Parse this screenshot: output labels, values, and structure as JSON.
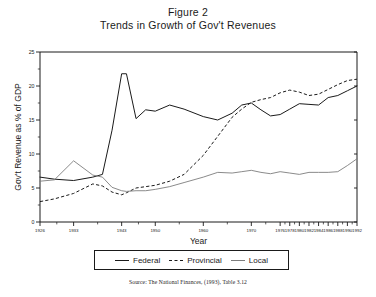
{
  "title": {
    "line1": "Figure 2",
    "line2": "Trends in Growth of Gov't Revenues"
  },
  "source": {
    "text": "Source:  The National Finances, (1993), Table 3.12"
  },
  "legend": {
    "federal": "Federal",
    "provincial": "Provincial",
    "local": "Local"
  },
  "chart_data": {
    "type": "line",
    "title": "Trends in Growth of Gov't Revenues",
    "subtitle": "Figure 2",
    "xlabel": "Year",
    "ylabel": "Gov't Revenue as % of GDP",
    "xlim": [
      1926,
      1992
    ],
    "ylim": [
      0,
      25
    ],
    "yticks": [
      0,
      5,
      10,
      15,
      20,
      25
    ],
    "ytick_labels": [
      "0",
      "5",
      "10",
      "15",
      "20",
      "25"
    ],
    "xtick_labels": [
      "1926",
      "1933",
      "1943",
      "1950",
      "1960",
      "1970",
      "1976",
      "1978",
      "1980",
      "1982",
      "1984",
      "1986",
      "1988",
      "1990",
      "1992"
    ],
    "xticks": [
      1926,
      1933,
      1943,
      1950,
      1960,
      1970,
      1976,
      1978,
      1980,
      1982,
      1984,
      1986,
      1988,
      1990,
      1992
    ],
    "grid": false,
    "legend_position": "bottom",
    "x": [
      1926,
      1929,
      1933,
      1937,
      1939,
      1941,
      1943,
      1944,
      1946,
      1948,
      1950,
      1953,
      1956,
      1960,
      1963,
      1966,
      1968,
      1970,
      1972,
      1974,
      1976,
      1978,
      1980,
      1982,
      1984,
      1986,
      1988,
      1990,
      1992
    ],
    "series": [
      {
        "name": "Federal",
        "style": "solid",
        "color": "#1a1a1a",
        "values": [
          6.6,
          6.3,
          6.1,
          6.6,
          7.0,
          13.5,
          21.8,
          21.8,
          15.2,
          16.5,
          16.3,
          17.2,
          16.6,
          15.5,
          15.0,
          16.0,
          17.2,
          17.5,
          16.5,
          15.6,
          15.8,
          16.6,
          17.4,
          17.3,
          17.2,
          18.3,
          18.6,
          19.3,
          20.0
        ]
      },
      {
        "name": "Provincial",
        "style": "dashed",
        "color": "#1a1a1a",
        "values": [
          3.0,
          3.4,
          4.2,
          5.6,
          5.3,
          4.4,
          4.0,
          4.3,
          5.0,
          5.2,
          5.4,
          6.0,
          7.0,
          9.8,
          12.6,
          15.4,
          16.6,
          17.6,
          18.0,
          18.3,
          19.0,
          19.4,
          19.1,
          18.6,
          18.8,
          19.5,
          20.2,
          20.8,
          21.0
        ]
      },
      {
        "name": "Local",
        "style": "solid-grey",
        "color": "#7d7d7d",
        "values": [
          6.0,
          6.2,
          9.0,
          6.9,
          6.6,
          5.1,
          4.6,
          4.5,
          4.6,
          4.6,
          4.8,
          5.2,
          5.8,
          6.6,
          7.3,
          7.2,
          7.4,
          7.6,
          7.3,
          7.1,
          7.4,
          7.2,
          7.0,
          7.3,
          7.3,
          7.3,
          7.4,
          8.3,
          9.3
        ]
      }
    ]
  }
}
